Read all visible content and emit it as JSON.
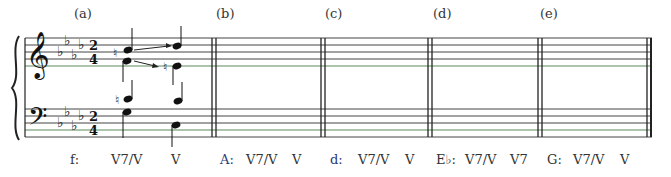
{
  "exercise": {
    "parts": [
      {
        "label": "(a)",
        "key": "f:",
        "chords": [
          "V7/V",
          "V"
        ]
      },
      {
        "label": "(b)",
        "key": "A:",
        "chords": [
          "V7/V",
          "V"
        ]
      },
      {
        "label": "(c)",
        "key": "d:",
        "chords": [
          "V7/V",
          "V"
        ]
      },
      {
        "label": "(d)",
        "key": "E♭:",
        "chords": [
          "V7/V",
          "V7"
        ]
      },
      {
        "label": "(e)",
        "key": "G:",
        "chords": [
          "V7/V",
          "V"
        ]
      }
    ],
    "time_signature": {
      "top": "2",
      "bottom": "4"
    },
    "key_signature": "4 flats"
  }
}
